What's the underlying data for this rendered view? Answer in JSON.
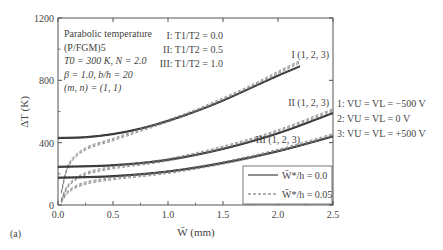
{
  "panel_label": "(a)",
  "chart_data": {
    "type": "line",
    "title": "",
    "xlabel": "W̄ (mm)",
    "ylabel": "ΔT (K)",
    "xlim": [
      0.0,
      2.5
    ],
    "ylim": [
      0,
      1200
    ],
    "xticks": [
      "0.0",
      "0.5",
      "1.0",
      "1.5",
      "2.0",
      "2.5"
    ],
    "yticks": [
      "0",
      "400",
      "800",
      "1200"
    ],
    "grid": false,
    "legend_position": "lower right inside",
    "legend": [
      {
        "label": "W̄*/h = 0.0",
        "style": "solid"
      },
      {
        "label": "W̄*/h = 0.05",
        "style": "dashed"
      }
    ],
    "annotations": {
      "params": [
        "Parabolic temperature",
        "(P/FGM)5",
        "T0 = 300 K, N = 2.0",
        "β = 1.0, b/h = 20",
        "(m, n) = (1, 1)"
      ],
      "cases": [
        "I: T1/T2 = 0.0",
        "II: T1/T2 = 0.5",
        "III: T1/T2 = 1.0"
      ],
      "voltages": [
        "1: VU = VL = −500 V",
        "2: VU = VL = 0 V",
        "3: VU = VL = +500 V"
      ],
      "curve_labels": [
        "I (1, 2, 3)",
        "II (1, 2, 3)",
        "III (1, 2, 3)"
      ]
    },
    "x": [
      0.0,
      0.25,
      0.5,
      0.75,
      1.0,
      1.25,
      1.5,
      1.75,
      2.0,
      2.2,
      2.5
    ],
    "series": [
      {
        "name": "I, W*/h=0.0",
        "style": "solid",
        "x": [
          0.0,
          0.25,
          0.5,
          0.75,
          1.0,
          1.25,
          1.5,
          1.75,
          2.0,
          2.2
        ],
        "values": [
          430,
          435,
          455,
          490,
          540,
          600,
          670,
          750,
          830,
          890
        ]
      },
      {
        "name": "I, W*/h=0.05",
        "style": "dashed",
        "x": [
          0.03,
          0.1,
          0.25,
          0.5,
          0.75,
          1.0,
          1.25,
          1.5,
          1.75,
          2.0,
          2.2
        ],
        "values": [
          80,
          260,
          360,
          420,
          480,
          540,
          605,
          680,
          760,
          850,
          920
        ]
      },
      {
        "name": "II, W*/h=0.0",
        "style": "solid",
        "x": [
          0.0,
          0.5,
          1.0,
          1.5,
          2.0,
          2.5
        ],
        "values": [
          245,
          255,
          290,
          360,
          460,
          590
        ]
      },
      {
        "name": "II, W*/h=0.05",
        "style": "dashed",
        "x": [
          0.03,
          0.1,
          0.25,
          0.5,
          1.0,
          1.5,
          2.0,
          2.5
        ],
        "values": [
          30,
          130,
          200,
          240,
          290,
          370,
          475,
          610
        ]
      },
      {
        "name": "III, W*/h=0.0",
        "style": "solid",
        "x": [
          0.0,
          0.5,
          1.0,
          1.5,
          2.0,
          2.5
        ],
        "values": [
          175,
          185,
          215,
          270,
          345,
          440
        ]
      },
      {
        "name": "III, W*/h=0.05",
        "style": "dashed",
        "x": [
          0.03,
          0.1,
          0.25,
          0.5,
          1.0,
          1.5,
          2.0,
          2.5
        ],
        "values": [
          20,
          90,
          140,
          170,
          210,
          270,
          350,
          450
        ]
      }
    ]
  }
}
